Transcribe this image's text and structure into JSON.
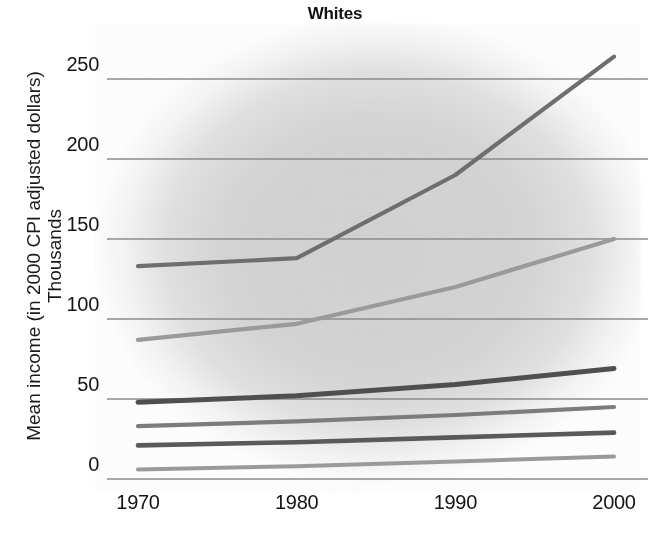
{
  "chart_data": {
    "type": "line",
    "title": "Whites",
    "xlabel": "",
    "ylabel": "Mean income (in 2000 CPI adjusted dollars)",
    "ylabel_line2": "Thousands",
    "x": [
      1970,
      1980,
      1990,
      2000
    ],
    "xtick_labels": [
      "1970",
      "1980",
      "1990",
      "2000"
    ],
    "ytick_labels": [
      "0",
      "50",
      "100",
      "150",
      "200",
      "250"
    ],
    "ytick_values": [
      0,
      50,
      100,
      150,
      200,
      250
    ],
    "xlim": [
      1970,
      2000
    ],
    "ylim": [
      0,
      262
    ],
    "grid": "horizontal",
    "legend": "none",
    "series": [
      {
        "name": "top-quantile",
        "values": [
          133,
          138,
          190,
          264
        ],
        "color": "#6e6e6e",
        "width": 4.2
      },
      {
        "name": "second-quantile",
        "values": [
          87,
          97,
          120,
          150
        ],
        "color": "#9a9a9a",
        "width": 4.2
      },
      {
        "name": "third-quantile",
        "values": [
          48,
          52,
          59,
          69
        ],
        "color": "#4f4f4f",
        "width": 5.0
      },
      {
        "name": "fourth-quantile",
        "values": [
          33,
          36,
          40,
          45
        ],
        "color": "#7c7c7c",
        "width": 4.2
      },
      {
        "name": "fifth-quantile",
        "values": [
          21,
          23,
          26,
          29
        ],
        "color": "#5a5a5a",
        "width": 4.6
      },
      {
        "name": "bottom-quantile",
        "values": [
          6,
          8,
          11,
          14
        ],
        "color": "#9a9a9a",
        "width": 4.0
      }
    ],
    "gridline_color": "#8b8b8b",
    "axis_color": "#8b8b8b",
    "background_color": "#c9c9c9"
  }
}
